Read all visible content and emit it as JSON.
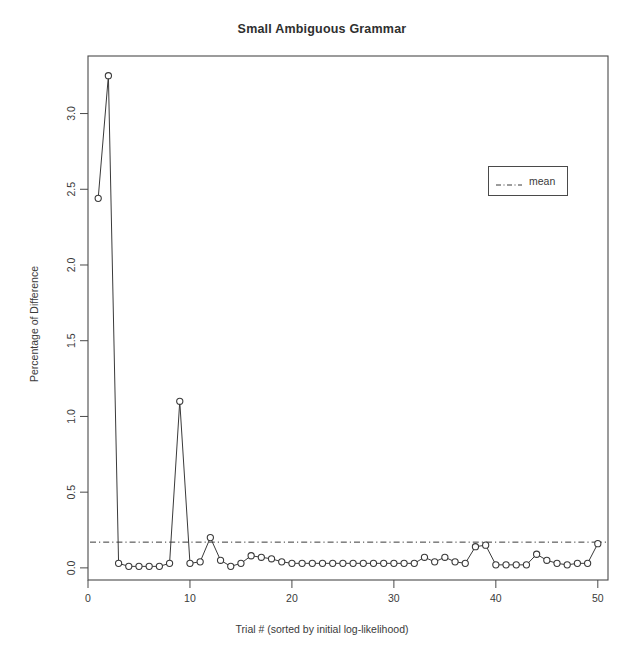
{
  "chart_data": {
    "type": "line",
    "title": "Small Ambiguous Grammar",
    "xlabel": "Trial # (sorted by initial log-likelihood)",
    "ylabel": "Percentage of Difference",
    "xlim": [
      0,
      51
    ],
    "ylim": [
      -0.08,
      3.38
    ],
    "xticks": [
      0,
      10,
      20,
      30,
      40,
      50
    ],
    "xtick_labels": [
      "0",
      "10",
      "20",
      "30",
      "40",
      "50"
    ],
    "yticks": [
      0.0,
      0.5,
      1.0,
      1.5,
      2.0,
      2.5,
      3.0
    ],
    "ytick_labels": [
      "0.0",
      "0.5",
      "1.0",
      "1.5",
      "2.0",
      "2.5",
      "3.0"
    ],
    "grid": false,
    "marker": "open-circle",
    "line_color": "#3a3a3a",
    "marker_color": "#3a3a3a",
    "legend_position": "top-right",
    "series": [
      {
        "name": "Percentage of Difference",
        "x": [
          1,
          2,
          3,
          4,
          5,
          6,
          7,
          8,
          9,
          10,
          11,
          12,
          13,
          14,
          15,
          16,
          17,
          18,
          19,
          20,
          21,
          22,
          23,
          24,
          25,
          26,
          27,
          28,
          29,
          30,
          31,
          32,
          33,
          34,
          35,
          36,
          37,
          38,
          39,
          40,
          41,
          42,
          43,
          44,
          45,
          46,
          47,
          48,
          49,
          50
        ],
        "values": [
          2.44,
          3.25,
          0.03,
          0.01,
          0.01,
          0.01,
          0.01,
          0.03,
          1.1,
          0.03,
          0.04,
          0.2,
          0.05,
          0.01,
          0.03,
          0.08,
          0.07,
          0.06,
          0.04,
          0.03,
          0.03,
          0.03,
          0.03,
          0.03,
          0.03,
          0.03,
          0.03,
          0.03,
          0.03,
          0.03,
          0.03,
          0.03,
          0.07,
          0.04,
          0.07,
          0.04,
          0.03,
          0.14,
          0.15,
          0.02,
          0.02,
          0.02,
          0.02,
          0.09,
          0.05,
          0.03,
          0.02,
          0.03,
          0.03,
          0.16
        ]
      }
    ],
    "reference_line": {
      "label": "mean",
      "value": 0.17,
      "style": "dash-dot",
      "color": "#3a3a3a"
    },
    "legend": [
      {
        "label": "mean",
        "style": "dash-dot",
        "color": "#3a3a3a"
      }
    ]
  }
}
